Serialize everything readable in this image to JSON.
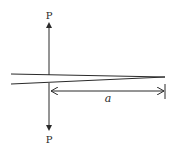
{
  "diagram": {
    "type": "double-cantilever-beam",
    "colors": {
      "stroke": "#2a2a2a",
      "background": "#ffffff"
    },
    "labels": {
      "load_top": "P",
      "load_bottom": "P",
      "crack_length": "a"
    },
    "geometry": {
      "load_line_x": 49,
      "upper_beam": {
        "x1": 11,
        "y1": 74,
        "x2": 165,
        "y2": 77
      },
      "lower_beam": {
        "x1": 11,
        "y1": 84,
        "x2": 165,
        "y2": 77
      },
      "dimension": {
        "x1": 50,
        "x2": 164,
        "y": 91,
        "tick_x": 165
      }
    }
  }
}
